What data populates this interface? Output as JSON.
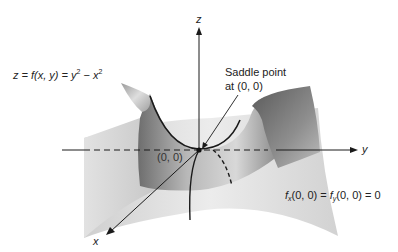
{
  "figure": {
    "function_label": {
      "lhs": "z = f(x, y) = ",
      "term1_base": "y",
      "term1_exp": "2",
      "minus": " − ",
      "term2_base": "x",
      "term2_exp": "2"
    },
    "annotation": {
      "line1": "Saddle point",
      "line2": "at (0, 0)"
    },
    "origin_label": "(0, 0)",
    "partials_label": {
      "f1": "f",
      "sub1": "x",
      "mid": "(0, 0) = ",
      "f2": "f",
      "sub2": "y",
      "end": "(0, 0) = 0"
    },
    "axes": {
      "x": "x",
      "y": "y",
      "z": "z"
    },
    "colors": {
      "surface_light": "#e6e6e6",
      "surface_dark": "#7a7a7a",
      "ink": "#1a1a1a",
      "background": "#ffffff"
    }
  }
}
